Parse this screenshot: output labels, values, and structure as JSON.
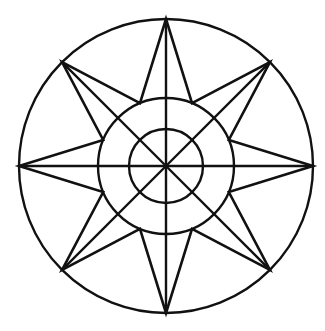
{
  "figure": {
    "name": "compass-rose",
    "background_color": "#ffffff",
    "stroke_color": "#111111",
    "canvas": {
      "width": 325,
      "height": 331
    }
  },
  "chart_data": {
    "type": "diagram",
    "subtitle": "",
    "xlabel": "",
    "ylabel": "",
    "grid": false,
    "legend": "none",
    "center": {
      "x": 166,
      "y": 166
    },
    "circles": [
      {
        "name": "outer-circle",
        "radius": 147,
        "stroke_width": 2.4
      },
      {
        "name": "middle-circle",
        "radius": 68,
        "stroke_width": 2.4
      },
      {
        "name": "inner-circle",
        "radius": 37,
        "stroke_width": 2.4
      }
    ],
    "star": {
      "points": 8,
      "outer_radius": 147,
      "inner_radius": 68,
      "rotation_deg": -90,
      "stroke_width": 2.6,
      "tip_angles_deg": [
        270,
        315,
        0,
        45,
        90,
        135,
        180,
        225
      ],
      "valley_angles_deg": [
        292.5,
        337.5,
        22.5,
        67.5,
        112.5,
        157.5,
        202.5,
        247.5
      ],
      "tip_labels": [
        "N",
        "NE",
        "E",
        "SE",
        "S",
        "SW",
        "W",
        "NW"
      ],
      "tip_coords": [
        {
          "label": "N",
          "x": 166,
          "y": 19
        },
        {
          "label": "NE",
          "x": 270,
          "y": 62
        },
        {
          "label": "E",
          "x": 313,
          "y": 166
        },
        {
          "label": "SE",
          "x": 270,
          "y": 270
        },
        {
          "label": "S",
          "x": 166,
          "y": 313
        },
        {
          "label": "SW",
          "x": 62,
          "y": 270
        },
        {
          "label": "W",
          "x": 19,
          "y": 166
        },
        {
          "label": "NW",
          "x": 62,
          "y": 62
        }
      ]
    },
    "spokes": {
      "count": 8,
      "angles_deg": [
        270,
        315,
        0,
        45,
        90,
        135,
        180,
        225
      ],
      "from_radius": 0,
      "to_radius": 147,
      "stroke_width": 2.4
    }
  }
}
